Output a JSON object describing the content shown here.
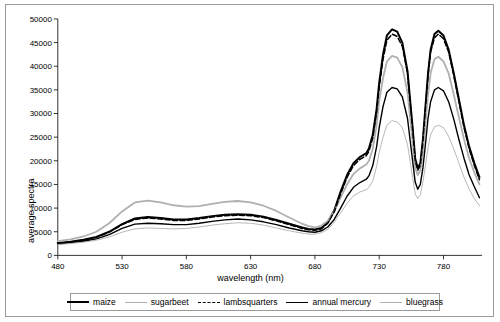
{
  "chart_data": {
    "type": "line",
    "title": "",
    "xlabel": "wavelength (nm)",
    "ylabel": "average spectra",
    "xlim": [
      480,
      810
    ],
    "ylim": [
      0,
      50000
    ],
    "xticks": [
      480,
      530,
      580,
      630,
      680,
      730,
      780
    ],
    "yticks": [
      0,
      5000,
      10000,
      15000,
      20000,
      25000,
      30000,
      35000,
      40000,
      45000,
      50000
    ],
    "grid": false,
    "legend_position": "bottom",
    "x": [
      480,
      490,
      500,
      510,
      520,
      530,
      540,
      550,
      560,
      570,
      580,
      590,
      600,
      610,
      620,
      630,
      640,
      650,
      660,
      670,
      675,
      680,
      685,
      690,
      695,
      700,
      705,
      710,
      715,
      720,
      722,
      725,
      728,
      730,
      733,
      736,
      740,
      744,
      748,
      752,
      756,
      758,
      760,
      762,
      764,
      766,
      768,
      770,
      773,
      776,
      780,
      784,
      788,
      792,
      796,
      800,
      804,
      808
    ],
    "series": [
      {
        "name": "maize",
        "style": "solid-thick",
        "color": "#000000",
        "values": [
          2600,
          2900,
          3300,
          3900,
          5000,
          6600,
          7800,
          8100,
          7900,
          7600,
          7600,
          7900,
          8300,
          8600,
          8700,
          8600,
          8200,
          7500,
          6700,
          5900,
          5600,
          5500,
          5800,
          7000,
          9500,
          13500,
          17000,
          19500,
          20800,
          21600,
          22600,
          25500,
          31000,
          36500,
          42500,
          46500,
          47800,
          47300,
          45000,
          39000,
          27000,
          20500,
          18500,
          19500,
          24500,
          31500,
          38500,
          43500,
          46800,
          47500,
          46500,
          43500,
          38500,
          33000,
          27500,
          23000,
          19500,
          16500
        ]
      },
      {
        "name": "sugarbeet",
        "style": "solid-light",
        "color": "#b0b0b0",
        "values": [
          3000,
          3400,
          4000,
          5000,
          6800,
          9300,
          11200,
          11600,
          11200,
          10600,
          10300,
          10400,
          10900,
          11300,
          11500,
          11200,
          10500,
          9400,
          8000,
          6700,
          6200,
          5900,
          6300,
          7300,
          9300,
          12200,
          15000,
          17200,
          18400,
          19200,
          20000,
          22500,
          27500,
          32500,
          37500,
          41000,
          42200,
          41800,
          39800,
          34500,
          24000,
          18500,
          17000,
          18000,
          22000,
          28000,
          34000,
          38500,
          41500,
          42000,
          41000,
          38500,
          34000,
          29200,
          24500,
          20500,
          17500,
          15000
        ]
      },
      {
        "name": "lambsquarters",
        "style": "dashed",
        "color": "#000000",
        "values": [
          2500,
          2800,
          3200,
          3800,
          4900,
          6500,
          7600,
          7900,
          7700,
          7400,
          7400,
          7700,
          8100,
          8400,
          8500,
          8400,
          8000,
          7300,
          6500,
          5700,
          5400,
          5300,
          5600,
          6800,
          9200,
          13000,
          16500,
          19000,
          20300,
          21100,
          22000,
          24800,
          30200,
          35500,
          41500,
          45500,
          46800,
          46300,
          44200,
          38500,
          26500,
          20000,
          18000,
          19000,
          24000,
          31000,
          38000,
          43000,
          46000,
          46800,
          45800,
          43000,
          38000,
          32500,
          27000,
          22500,
          19000,
          16000
        ]
      },
      {
        "name": "annual mercury",
        "style": "solid-medium",
        "color": "#000000",
        "values": [
          2400,
          2700,
          3000,
          3500,
          4400,
          5700,
          6600,
          6800,
          6700,
          6500,
          6500,
          6800,
          7200,
          7500,
          7700,
          7500,
          7100,
          6500,
          5800,
          5200,
          5000,
          4900,
          5200,
          6000,
          7600,
          10000,
          12500,
          14400,
          15400,
          16100,
          16800,
          19000,
          23000,
          27000,
          31500,
          34500,
          35500,
          35200,
          33500,
          29000,
          20000,
          15500,
          14000,
          15000,
          18500,
          23500,
          29000,
          32500,
          35000,
          35500,
          34800,
          32500,
          28800,
          24500,
          20500,
          17000,
          14500,
          12200
        ]
      },
      {
        "name": "bluegrass",
        "style": "solid-thin",
        "color": "#b0b0b0",
        "values": [
          2300,
          2500,
          2800,
          3200,
          3900,
          4900,
          5600,
          5800,
          5700,
          5600,
          5700,
          6000,
          6400,
          6700,
          6900,
          6800,
          6400,
          5800,
          5200,
          4700,
          4500,
          4500,
          4800,
          5500,
          7000,
          9000,
          11000,
          12600,
          13400,
          13900,
          14400,
          15800,
          18800,
          21800,
          25000,
          27500,
          28500,
          28200,
          27000,
          23500,
          16500,
          13000,
          12000,
          12800,
          15500,
          19000,
          22800,
          25500,
          27200,
          27500,
          27000,
          25200,
          22500,
          19500,
          16500,
          14000,
          12000,
          10500
        ]
      }
    ]
  },
  "axes": {
    "y_label": "average spectra",
    "x_label": "wavelength (nm)"
  },
  "legend": {
    "items": [
      {
        "label": "maize"
      },
      {
        "label": "sugarbeet"
      },
      {
        "label": "lambsquarters"
      },
      {
        "label": "annual mercury"
      },
      {
        "label": "bluegrass"
      }
    ]
  }
}
